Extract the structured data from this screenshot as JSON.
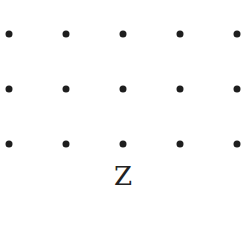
{
  "diagram": {
    "type": "dot-lattice",
    "rows": 3,
    "columns": 5,
    "dot_color": "#1e1e1e",
    "x_positions": [
      9,
      66,
      123,
      180,
      237
    ],
    "y_positions": [
      34,
      89,
      144
    ],
    "label": "Z"
  }
}
